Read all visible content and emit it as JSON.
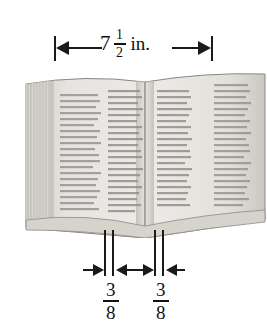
{
  "top_dimension": {
    "whole": "7",
    "numerator": "1",
    "denominator": "2",
    "unit": "in.",
    "full_label": "7 1/2 in.",
    "arrow_left": "arrow-left-icon",
    "arrow_right": "arrow-right-icon"
  },
  "bottom_dimensions": [
    {
      "numerator": "3",
      "denominator": "8",
      "full_label": "3/8"
    },
    {
      "numerator": "3",
      "denominator": "8",
      "full_label": "3/8"
    }
  ],
  "book": {
    "name": "open-book-illustration",
    "columns": 4,
    "colors": {
      "page": "#e8e6e2",
      "page_shade": "#d2cfc9",
      "edge": "#bcb8b1",
      "text": "#8d8a86",
      "outline": "#7a7670",
      "spine_shadow": "#b4b0a9"
    }
  },
  "colors": {
    "background": "#ffffff",
    "ink": "#1a1a1a",
    "text": "#111111"
  }
}
